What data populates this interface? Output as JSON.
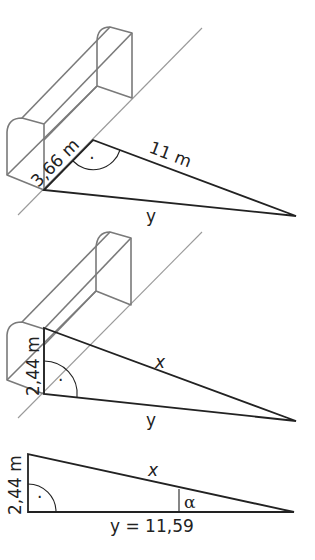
{
  "diagram": {
    "panel1": {
      "goal_width_label": "3,66 m",
      "distance_label": "11 m",
      "hypotenuse_label": "y",
      "right_angle_marker": "·"
    },
    "panel2": {
      "goal_height_label": "2,44 m",
      "slant_label": "x",
      "ground_label": "y",
      "right_angle_marker": "·"
    },
    "panel3": {
      "height_label": "2,44 m",
      "hypotenuse_label": "x",
      "base_label": "y = 11,59",
      "angle_label": "α",
      "right_angle_marker": "·"
    }
  },
  "colors": {
    "goal_stroke": "#7a7a7a",
    "goal_line": "#9a9a9a",
    "triangle_stroke": "#222222"
  }
}
